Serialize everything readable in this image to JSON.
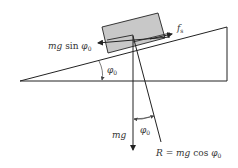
{
  "diagram": {
    "type": "free-body diagram on inclined plane",
    "labels": {
      "friction": "f",
      "friction_sub": "s",
      "parallel_force_italic": "mg",
      "parallel_force_func": " sin ",
      "parallel_force_phi": "φ",
      "parallel_force_sub": "0",
      "angle_incline_phi": "φ",
      "angle_incline_sub": "0",
      "weight": "mg",
      "angle_normal_phi": "φ",
      "angle_normal_sub": "0",
      "normal_R": "R",
      "normal_eq": " = ",
      "normal_mg": "mg",
      "normal_func": " cos ",
      "normal_phi": "φ",
      "normal_sub": "0"
    },
    "colors": {
      "line": "#222222",
      "block_fill": "#c8c8c8",
      "text": "#333333"
    }
  }
}
